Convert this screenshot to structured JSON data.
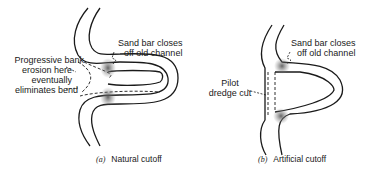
{
  "panel_a": {
    "label_sandbar": [
      "Sand bar closes",
      "off old channel"
    ],
    "label_erosion": [
      "Progressive bank",
      "erosion here",
      "eventually",
      "eliminates bend"
    ],
    "caption_letter": "(a)",
    "caption_text": "Natural cutoff"
  },
  "panel_b": {
    "label_sandbar": [
      "Sand bar closes",
      "off old channel"
    ],
    "label_pilot": [
      "Pilot",
      "dredge cut"
    ],
    "caption_letter": "(b)",
    "caption_text": "Artificial cutoff"
  }
}
